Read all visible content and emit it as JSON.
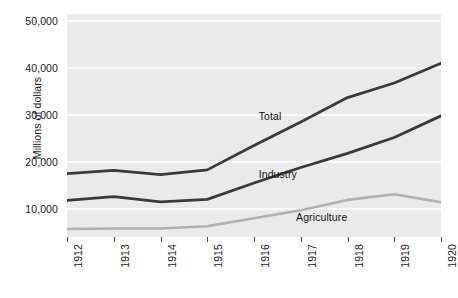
{
  "chart_data": {
    "type": "line",
    "title": "",
    "subtitle": "",
    "xlabel": "",
    "ylabel": "Millions of dollars",
    "x": [
      1912,
      1913,
      1914,
      1915,
      1916,
      1917,
      1918,
      1919,
      1920
    ],
    "xtick_labels": [
      "1912",
      "1913",
      "1914",
      "1915",
      "1916",
      "1917",
      "1918",
      "1919",
      "1920"
    ],
    "ytick_labels": [
      "50,000",
      "40,000",
      "30,000",
      "20,000",
      "10,000"
    ],
    "ytick_values": [
      50000,
      40000,
      30000,
      20000,
      10000
    ],
    "ylim": [
      4000,
      51500
    ],
    "xlim": [
      1912,
      1920
    ],
    "grid": "horizontal",
    "legend": "inline-annotations",
    "plot_background": "#eaeaea",
    "gridline_color": "#fafafa",
    "series": [
      {
        "name": "Total",
        "color": "#3a3a3a",
        "values": [
          17500,
          18200,
          17300,
          18300,
          23500,
          28500,
          33700,
          36800,
          41000
        ],
        "label_x": 1916.1,
        "label_y": 29500
      },
      {
        "name": "Industry",
        "color": "#3a3a3a",
        "values": [
          11800,
          12600,
          11500,
          12000,
          15500,
          18800,
          21800,
          25200,
          29800
        ],
        "label_x": 1916.1,
        "label_y": 17300
      },
      {
        "name": "Agriculture",
        "color": "#b0b0b0",
        "values": [
          5700,
          5800,
          5800,
          6300,
          8000,
          9700,
          11900,
          13100,
          11400
        ],
        "label_x": 1916.9,
        "label_y": 8100
      }
    ]
  }
}
